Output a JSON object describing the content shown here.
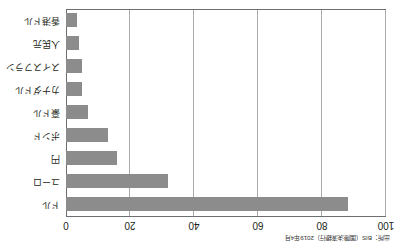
{
  "figure": {
    "rotation_degrees": 180,
    "source_note": "出所：BIS（国際決済銀行）2019年4月",
    "bar_color": "#8c8c8c",
    "gridline_color": "#a7a9ac",
    "axis_color": "#6d6e71"
  },
  "chart_data": {
    "type": "bar",
    "orientation": "horizontal",
    "title": "",
    "subtitle": "",
    "xlabel": "",
    "ylabel": "",
    "xlim": [
      0,
      100
    ],
    "categories": [
      "ドル",
      "ユーロ",
      "円",
      "ポンド",
      "豪ドル",
      "カナダドル",
      "スイスフラン",
      "人民元",
      "香港ドル"
    ],
    "values": [
      88,
      32,
      16,
      13,
      7,
      5,
      5,
      4,
      3.5
    ],
    "tick_values": [
      0,
      20,
      40,
      60,
      80,
      100
    ],
    "tick_labels": [
      "0",
      "20",
      "40",
      "60",
      "80",
      "100"
    ],
    "grid": true,
    "legend": null,
    "annotations": [
      "出所：BIS（国際決済銀行）2019年4月"
    ]
  }
}
